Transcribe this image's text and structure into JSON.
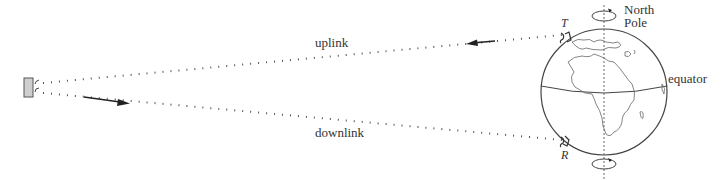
{
  "labels": {
    "uplink": "uplink",
    "downlink": "downlink",
    "north_pole_line1": "North",
    "north_pole_line2": "Pole",
    "equator": "equator",
    "transmitter": "T",
    "receiver": "R"
  },
  "colors": {
    "line": "#333333",
    "globe_stroke": "#444444",
    "satellite_fill": "#cfcfcf",
    "text": "#333333"
  }
}
